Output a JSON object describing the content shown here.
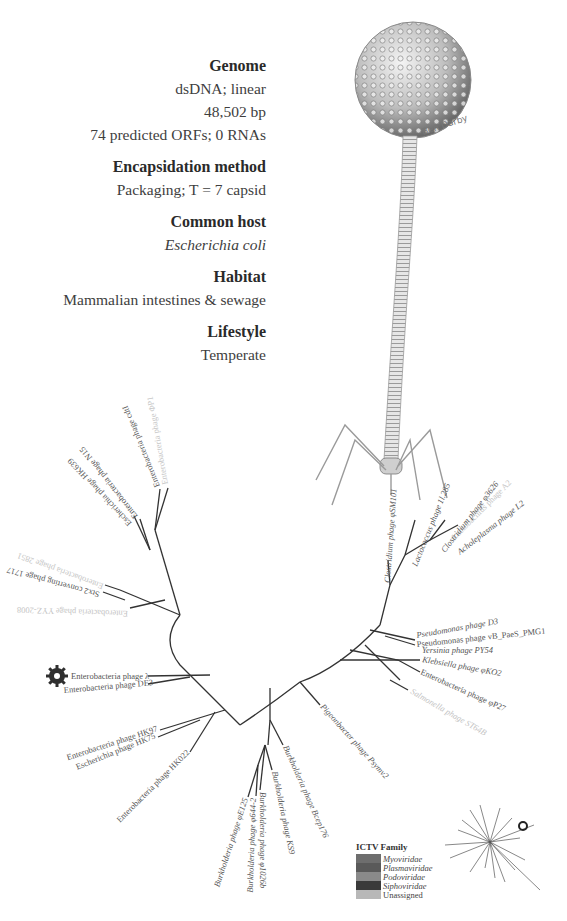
{
  "info": {
    "sections": [
      {
        "heading": "Genome",
        "values": [
          "dsDNA; linear",
          "48,502 bp",
          "74 predicted ORFs; 0 RNAs"
        ]
      },
      {
        "heading": "Encapsidation method",
        "values": [
          "Packaging; T = 7 capsid"
        ]
      },
      {
        "heading": "Common host",
        "values": [
          "Escherichia coli"
        ]
      },
      {
        "heading": "Habitat",
        "values": [
          "Mammalian intestines & sewage"
        ]
      },
      {
        "heading": "Lifestyle",
        "values": [
          "Temperate"
        ]
      }
    ]
  },
  "illustration": {
    "subject": "bacteriophage-drawing",
    "signature": "Ben Darby"
  },
  "tree": {
    "highlight_icon": "virus-icon",
    "leaves": [
      {
        "label": "Enterobacteria phage ΦP1",
        "faint": true
      },
      {
        "label": "Enterobacteria phage cdtI",
        "faint": false
      },
      {
        "label": "Enterobacteria phage N15",
        "faint": false
      },
      {
        "label": "Escherichia phage HK639",
        "faint": false
      },
      {
        "label": "Enterobacteria phage 2851",
        "faint": true
      },
      {
        "label": "Stx2 converting phage 1717",
        "faint": false
      },
      {
        "label": "Enterobacteria phage YYZ-2008",
        "faint": true
      },
      {
        "label": "Enterobacteria phage λ",
        "faint": false
      },
      {
        "label": "Enterobacteria phage DE3",
        "faint": false
      },
      {
        "label": "Enterobacteria phage HK97",
        "faint": false
      },
      {
        "label": "Escherichia phage HK75",
        "faint": false
      },
      {
        "label": "Enterobacteria phage HK022",
        "faint": false
      },
      {
        "label": "Burkholderia phage φE125",
        "faint": false
      },
      {
        "label": "Burkholderia phage φ644-2",
        "faint": false
      },
      {
        "label": "Burkholderia phage φ1026b",
        "faint": false
      },
      {
        "label": "Burkholderia phage KS9",
        "faint": false
      },
      {
        "label": "Burkholderia phage Bcep176",
        "faint": false
      },
      {
        "label": "Pigeonbacter phage Psymv2",
        "faint": false
      },
      {
        "label": "Salmonella phage ST64B",
        "faint": true
      },
      {
        "label": "Enterobacteria phage φP27",
        "faint": false
      },
      {
        "label": "Klebsiella phage φKO2",
        "faint": false
      },
      {
        "label": "Yersinia phage PY54",
        "faint": false
      },
      {
        "label": "Pseudomonas phage vB_PaeS_PMG1",
        "faint": false
      },
      {
        "label": "Pseudomonas phage D3",
        "faint": false
      },
      {
        "label": "Acholeplasma phage L2",
        "faint": false
      },
      {
        "label": "Lactobacillus phage A2",
        "faint": true
      },
      {
        "label": "Clostridium phage φ3626",
        "faint": false
      },
      {
        "label": "Lactococcus phage 1l.285",
        "faint": false
      },
      {
        "label": "Clostridium phage φSM101",
        "faint": false
      }
    ]
  },
  "legend": {
    "title": "ICTV Family",
    "items": [
      {
        "name": "Myoviridae",
        "color": "#6e6e6e"
      },
      {
        "name": "Plasmaviridae",
        "color": "#5a5a5a"
      },
      {
        "name": "Podoviridae",
        "color": "#8a8a8a"
      },
      {
        "name": "Siphoviridae",
        "color": "#3a3a3a"
      },
      {
        "name": "Unassigned",
        "color": "#b8b8b8"
      }
    ]
  }
}
